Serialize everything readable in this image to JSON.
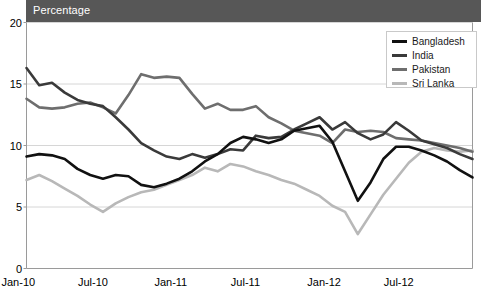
{
  "title": "Percentage",
  "legend": {
    "position": "top-right",
    "items": [
      {
        "label": "Bangladesh",
        "color": "#111111"
      },
      {
        "label": "India",
        "color": "#3a3a3a"
      },
      {
        "label": "Pakistan",
        "color": "#6e6e6e"
      },
      {
        "label": "Sri Lanka",
        "color": "#b8b8b8"
      }
    ]
  },
  "axes": {
    "y_ticks": [
      "0",
      "5",
      "10",
      "15",
      "20"
    ],
    "x_ticks": [
      "Jan-10",
      "Jul-10",
      "Jan-11",
      "Jul-11",
      "Jan-12",
      "Jul-12"
    ]
  },
  "colors": {
    "banner": "#575757",
    "banner_text": "#ffffff",
    "gridline": "#d6d6d6",
    "axis": "#9a9a9a",
    "plot_background": "#ffffff"
  },
  "chart_data": {
    "type": "line",
    "title": "Percentage",
    "xlabel": "",
    "ylabel": "Percentage",
    "ylim": [
      0,
      20
    ],
    "yticks": [
      0,
      5,
      10,
      15,
      20
    ],
    "grid": true,
    "legend_position": "top-right",
    "x": [
      "Jan-10",
      "Feb-10",
      "Mar-10",
      "Apr-10",
      "May-10",
      "Jun-10",
      "Jul-10",
      "Aug-10",
      "Sep-10",
      "Oct-10",
      "Nov-10",
      "Dec-10",
      "Jan-11",
      "Feb-11",
      "Mar-11",
      "Apr-11",
      "May-11",
      "Jun-11",
      "Jul-11",
      "Aug-11",
      "Sep-11",
      "Oct-11",
      "Nov-11",
      "Dec-11",
      "Jan-12",
      "Feb-12",
      "Mar-12",
      "Apr-12",
      "May-12",
      "Jun-12",
      "Jul-12",
      "Aug-12",
      "Sep-12",
      "Oct-12",
      "Nov-12",
      "Dec-12"
    ],
    "xtick_labels": [
      "Jan-10",
      "Jul-10",
      "Jan-11",
      "Jul-11",
      "Jan-12",
      "Jul-12"
    ],
    "xtick_indices": [
      0,
      6,
      12,
      18,
      24,
      30
    ],
    "series": [
      {
        "name": "Bangladesh",
        "color": "#111111",
        "values": [
          9.1,
          9.3,
          9.2,
          8.9,
          8.1,
          7.6,
          7.3,
          7.6,
          7.5,
          6.8,
          6.6,
          6.9,
          7.3,
          7.9,
          8.7,
          9.3,
          10.2,
          10.7,
          10.5,
          10.2,
          10.5,
          11.2,
          11.4,
          11.6,
          10.3,
          7.9,
          5.5,
          7.0,
          8.9,
          9.9,
          9.9,
          9.6,
          9.2,
          8.7,
          8.0,
          7.4
        ]
      },
      {
        "name": "India",
        "color": "#3a3a3a",
        "values": [
          16.3,
          14.9,
          15.1,
          14.3,
          13.7,
          13.4,
          13.2,
          12.3,
          11.3,
          10.2,
          9.6,
          9.1,
          8.9,
          9.3,
          9.0,
          9.3,
          9.7,
          9.6,
          10.8,
          10.6,
          10.7,
          11.3,
          11.8,
          12.3,
          11.3,
          11.9,
          11.0,
          10.5,
          10.9,
          11.9,
          11.2,
          10.4,
          10.1,
          9.8,
          9.3,
          8.9
        ]
      },
      {
        "name": "Pakistan",
        "color": "#6e6e6e",
        "values": [
          13.8,
          13.1,
          13.0,
          13.1,
          13.4,
          13.5,
          13.1,
          12.6,
          14.1,
          15.8,
          15.5,
          15.6,
          15.5,
          14.2,
          13.0,
          13.4,
          12.9,
          12.9,
          13.2,
          12.3,
          11.8,
          11.2,
          11.0,
          10.8,
          10.2,
          11.3,
          11.1,
          11.2,
          11.1,
          10.6,
          10.5,
          10.4,
          10.2,
          10.0,
          9.8,
          9.5
        ]
      },
      {
        "name": "Sri Lanka",
        "color": "#b8b8b8",
        "values": [
          7.2,
          7.6,
          7.1,
          6.5,
          5.9,
          5.2,
          4.6,
          5.3,
          5.8,
          6.2,
          6.4,
          6.8,
          7.2,
          7.6,
          8.2,
          7.9,
          8.5,
          8.3,
          7.9,
          7.6,
          7.2,
          6.9,
          6.4,
          5.9,
          5.1,
          4.6,
          2.8,
          4.4,
          6.0,
          7.3,
          8.6,
          9.5,
          9.8,
          9.6,
          9.5,
          9.6
        ]
      }
    ]
  }
}
